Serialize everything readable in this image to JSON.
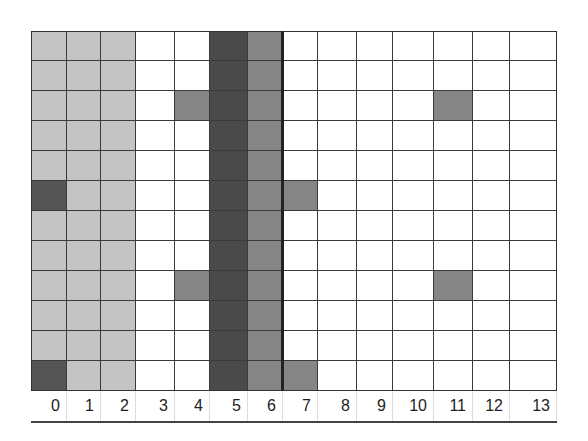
{
  "diagram": {
    "rows": 12,
    "cols": 14,
    "column_labels": [
      "0",
      "1",
      "2",
      "3",
      "4",
      "5",
      "6",
      "7",
      "8",
      "9",
      "10",
      "11",
      "12",
      "13"
    ],
    "column_edges": [
      31,
      67,
      101,
      136,
      175,
      210,
      248,
      283,
      318,
      357,
      393,
      434,
      473,
      510,
      557
    ],
    "row_height": 30,
    "colors": {
      "white": "#ffffff",
      "light": "#c4c4c4",
      "medium": "#858585",
      "dark": "#555555",
      "darkest": "#4a4a4a"
    },
    "column_base_fill": [
      "light",
      "light",
      "light",
      "white",
      "white",
      "darkest",
      "medium",
      "white",
      "white",
      "white",
      "white",
      "white",
      "white",
      "white"
    ],
    "highlighted_cells": [
      {
        "row": 5,
        "col": 0,
        "fill": "dark"
      },
      {
        "row": 11,
        "col": 0,
        "fill": "dark"
      },
      {
        "row": 2,
        "col": 4,
        "fill": "medium"
      },
      {
        "row": 8,
        "col": 4,
        "fill": "medium"
      },
      {
        "row": 5,
        "col": 7,
        "fill": "medium"
      },
      {
        "row": 11,
        "col": 7,
        "fill": "medium"
      },
      {
        "row": 2,
        "col": 11,
        "fill": "medium"
      },
      {
        "row": 8,
        "col": 11,
        "fill": "medium"
      }
    ],
    "thick_divider_after_col": 6
  }
}
